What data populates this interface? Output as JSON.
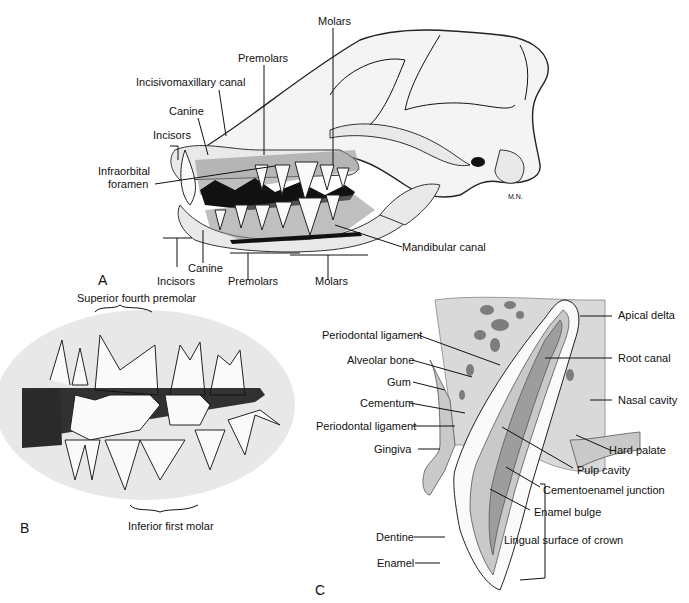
{
  "figure": {
    "panels": [
      {
        "id": "A",
        "letter": "A",
        "subject": "Canine skull lateral view with dentition exposed",
        "labels": {
          "molars_top": "Molars",
          "premolars_top": "Premolars",
          "incisivomaxillary_canal": "Incisivomaxillary canal",
          "canine_top": "Canine",
          "incisors_top": "Incisors",
          "infraorbital_foramen_line1": "Infraorbital",
          "infraorbital_foramen_line2": "foramen",
          "mandibular_canal": "Mandibular canal",
          "incisors_bottom": "Incisors",
          "canine_bottom": "Canine",
          "premolars_bottom": "Premolars",
          "molars_bottom": "Molars",
          "artist_signature": "M.N."
        }
      },
      {
        "id": "B",
        "letter": "B",
        "subject": "Occlusion of carnassial teeth",
        "labels": {
          "superior": "Superior fourth premolar",
          "inferior": "Inferior first molar"
        }
      },
      {
        "id": "C",
        "letter": "C",
        "subject": "Canine tooth cross-section",
        "labels": {
          "apical_delta": "Apical delta",
          "periodontal_ligament_1": "Periodontal ligament",
          "root_canal": "Root canal",
          "alveolar_bone": "Alveolar bone",
          "gum": "Gum",
          "nasal_cavity": "Nasal cavity",
          "cementum": "Cementum",
          "periodontal_ligament_2": "Periodontal ligament",
          "hard_palate": "Hard palate",
          "gingiva": "Gingiva",
          "pulp_cavity": "Pulp cavity",
          "cementoenamel_junction": "Cementoenamel junction",
          "enamel_bulge": "Enamel bulge",
          "dentine": "Dentine",
          "lingual_surface": "Lingual surface of crown",
          "enamel": "Enamel"
        }
      }
    ]
  }
}
